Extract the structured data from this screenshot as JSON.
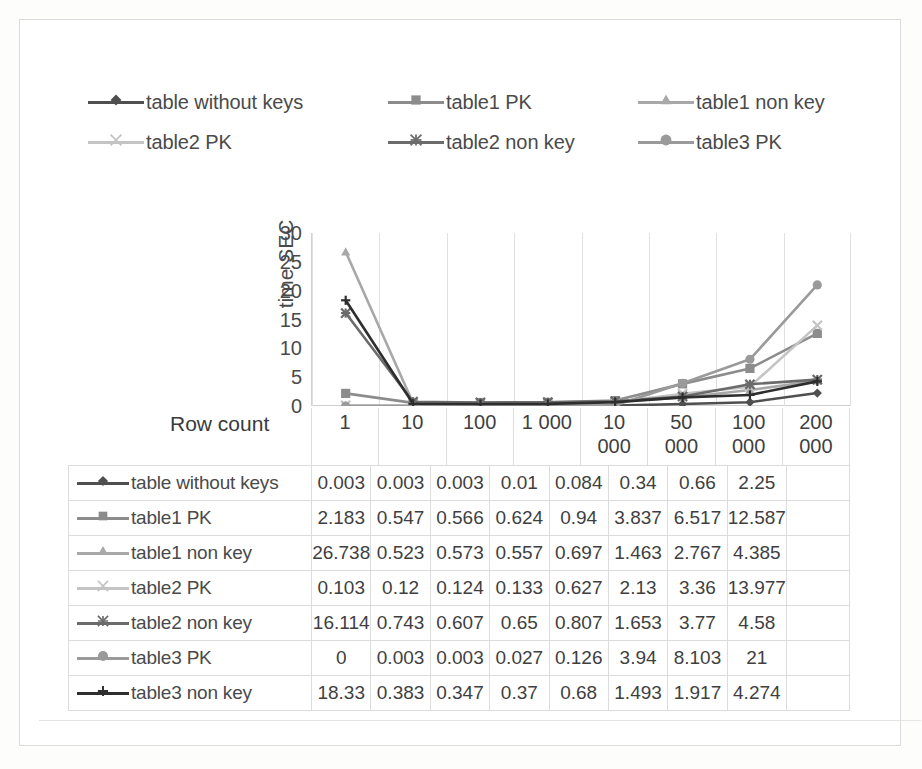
{
  "chart_data": {
    "type": "line",
    "title": "",
    "xlabel": "Row count",
    "ylabel": "time SEC",
    "ylim": [
      0,
      30
    ],
    "yticks": [
      30,
      25,
      20,
      15,
      10,
      5,
      0
    ],
    "grid": true,
    "legend_position": "top",
    "categories": [
      "1",
      "10",
      "100",
      "1 000",
      "10 000",
      "50 000",
      "100 000",
      "200 000"
    ],
    "series": [
      {
        "name": "table without keys",
        "marker": "diamond",
        "color": "#4f4f4f",
        "values": [
          0.003,
          0.003,
          0.003,
          0.01,
          0.084,
          0.34,
          0.66,
          2.25
        ]
      },
      {
        "name": "table1 PK",
        "marker": "square",
        "color": "#8c8c8c",
        "values": [
          2.183,
          0.547,
          0.566,
          0.624,
          0.94,
          3.837,
          6.517,
          12.587
        ]
      },
      {
        "name": "table1 non key",
        "marker": "triangle",
        "color": "#a8a8a8",
        "values": [
          26.738,
          0.523,
          0.573,
          0.557,
          0.697,
          1.463,
          2.767,
          4.385
        ]
      },
      {
        "name": "table2 PK",
        "marker": "x",
        "color": "#c4c4c4",
        "values": [
          0.103,
          0.12,
          0.124,
          0.133,
          0.627,
          2.13,
          3.36,
          13.977
        ]
      },
      {
        "name": "table2 non key",
        "marker": "asterisk",
        "color": "#6b6b6b",
        "values": [
          16.114,
          0.743,
          0.607,
          0.65,
          0.807,
          1.653,
          3.77,
          4.58
        ]
      },
      {
        "name": "table3 PK",
        "marker": "circle",
        "color": "#9a9a9a",
        "values": [
          0,
          0.003,
          0.003,
          0.027,
          0.126,
          3.94,
          8.103,
          21
        ]
      },
      {
        "name": "table3 non key",
        "marker": "plus",
        "color": "#2e2e2e",
        "values": [
          18.33,
          0.383,
          0.347,
          0.37,
          0.68,
          1.493,
          1.917,
          4.274
        ]
      }
    ]
  },
  "legend": {
    "rows": [
      [
        {
          "label": "table without keys",
          "marker": "diamond",
          "color": "#4f4f4f"
        },
        {
          "label": "table1 PK",
          "marker": "square",
          "color": "#8c8c8c"
        },
        {
          "label": "table1 non key",
          "marker": "triangle",
          "color": "#a8a8a8"
        }
      ],
      [
        {
          "label": "table2 PK",
          "marker": "x",
          "color": "#c4c4c4"
        },
        {
          "label": "table2 non key",
          "marker": "asterisk",
          "color": "#6b6b6b"
        },
        {
          "label": "table3 PK",
          "marker": "circle",
          "color": "#9a9a9a"
        }
      ]
    ]
  },
  "axis": {
    "y_title": "time SEC",
    "x_title": "Row count",
    "y_ticks": [
      "30",
      "25",
      "20",
      "15",
      "10",
      "5",
      "0"
    ],
    "x_categories": [
      {
        "line1": "1",
        "line2": ""
      },
      {
        "line1": "10",
        "line2": ""
      },
      {
        "line1": "100",
        "line2": ""
      },
      {
        "line1": "1 000",
        "line2": ""
      },
      {
        "line1": "10",
        "line2": "000"
      },
      {
        "line1": "50",
        "line2": "000"
      },
      {
        "line1": "100",
        "line2": "000"
      },
      {
        "line1": "200",
        "line2": "000"
      }
    ]
  },
  "table": {
    "rows": [
      {
        "label": "table without keys",
        "marker": "diamond",
        "color": "#4f4f4f",
        "cells": [
          "0.003",
          "0.003",
          "0.003",
          "0.01",
          "0.084",
          "0.34",
          "0.66",
          "2.25"
        ]
      },
      {
        "label": "table1 PK",
        "marker": "square",
        "color": "#8c8c8c",
        "cells": [
          "2.183",
          "0.547",
          "0.566",
          "0.624",
          "0.94",
          "3.837",
          "6.517",
          "12.587"
        ]
      },
      {
        "label": "table1 non key",
        "marker": "triangle",
        "color": "#a8a8a8",
        "cells": [
          "26.738",
          "0.523",
          "0.573",
          "0.557",
          "0.697",
          "1.463",
          "2.767",
          "4.385"
        ]
      },
      {
        "label": "table2 PK",
        "marker": "x",
        "color": "#c4c4c4",
        "cells": [
          "0.103",
          "0.12",
          "0.124",
          "0.133",
          "0.627",
          "2.13",
          "3.36",
          "13.977"
        ]
      },
      {
        "label": "table2 non key",
        "marker": "asterisk",
        "color": "#6b6b6b",
        "cells": [
          "16.114",
          "0.743",
          "0.607",
          "0.65",
          "0.807",
          "1.653",
          "3.77",
          "4.58"
        ]
      },
      {
        "label": "table3 PK",
        "marker": "circle",
        "color": "#9a9a9a",
        "cells": [
          "0",
          "0.003",
          "0.003",
          "0.027",
          "0.126",
          "3.94",
          "8.103",
          "21"
        ]
      },
      {
        "label": "table3 non key",
        "marker": "plus",
        "color": "#2e2e2e",
        "cells": [
          "18.33",
          "0.383",
          "0.347",
          "0.37",
          "0.68",
          "1.493",
          "1.917",
          "4.274"
        ]
      }
    ]
  },
  "colors": {
    "grid": "#e0e0e0",
    "border": "#dcdcdc",
    "text": "#3f3f3f",
    "background": "#ffffff"
  }
}
